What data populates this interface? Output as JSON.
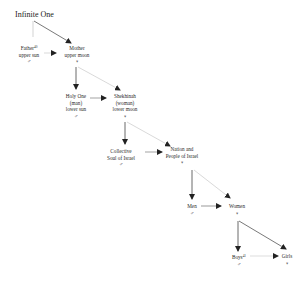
{
  "diagram": {
    "title": "Infinite One",
    "nodes": {
      "father": {
        "lines": [
          "Father",
          "upper sun"
        ],
        "sup": "40",
        "symbol": "♂"
      },
      "mother": {
        "lines": [
          "Mother",
          "upper moon"
        ],
        "symbol": "♀"
      },
      "holy_one": {
        "lines": [
          "Holy One",
          "(man)",
          "lower sun"
        ],
        "symbol": "♂"
      },
      "shekhinah": {
        "lines": [
          "Shekhinah",
          "(woman)",
          "lower moon"
        ],
        "symbol": "♀"
      },
      "collective_soul": {
        "lines": [
          "Collective",
          "Soul of Israel"
        ],
        "symbol": "♂"
      },
      "nation": {
        "lines": [
          "Nation and",
          "People of Israel"
        ],
        "symbol": "♀"
      },
      "men": {
        "lines": [
          "Men"
        ],
        "symbol": "♂"
      },
      "women": {
        "lines": [
          "Women"
        ],
        "symbol": "♀"
      },
      "boys": {
        "lines": [
          "Boys"
        ],
        "sup": "41",
        "symbol": "♂"
      },
      "girls": {
        "lines": [
          "Girls"
        ],
        "symbol": "♀"
      }
    },
    "edges": [
      {
        "from": "Infinite One",
        "to": "Father",
        "style": "light line, no arrow"
      },
      {
        "from": "Infinite One",
        "to": "Mother",
        "style": "dark arrow"
      },
      {
        "from": "Father",
        "to": "Mother",
        "style": "light arrow"
      },
      {
        "from": "Mother",
        "to": "Holy One",
        "style": "dark arrow"
      },
      {
        "from": "Mother",
        "to": "Shekhinah",
        "style": "light arrow"
      },
      {
        "from": "Holy One",
        "to": "Shekhinah",
        "style": "dark arrow"
      },
      {
        "from": "Shekhinah",
        "to": "Collective Soul of Israel",
        "style": "dark arrow"
      },
      {
        "from": "Shekhinah",
        "to": "Nation and People of Israel",
        "style": "light arrow"
      },
      {
        "from": "Collective Soul of Israel",
        "to": "Nation and People of Israel",
        "style": "dark arrow"
      },
      {
        "from": "Nation and People of Israel",
        "to": "Men",
        "style": "dark arrow"
      },
      {
        "from": "Nation and People of Israel",
        "to": "Women",
        "style": "light arrow"
      },
      {
        "from": "Men",
        "to": "Women",
        "style": "dark arrow"
      },
      {
        "from": "Women",
        "to": "Boys",
        "style": "dark arrow"
      },
      {
        "from": "Women",
        "to": "Girls",
        "style": "dark arrow"
      },
      {
        "from": "Boys",
        "to": "Girls",
        "style": "light arrow"
      }
    ],
    "colors": {
      "dark_line": "#444444",
      "light_line": "#c8c8c8",
      "text": "#2a2a2a"
    }
  }
}
